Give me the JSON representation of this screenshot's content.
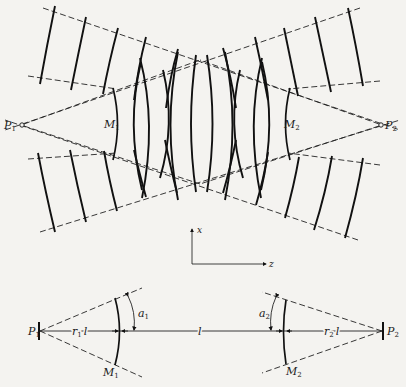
{
  "figure": {
    "top_diagram": {
      "description": "Unstable resonator wavefronts between mirrors M1 and M2 with virtual point sources P1 and P2",
      "labels": {
        "p1": "P",
        "p1_sub": "1",
        "p2": "P",
        "p2_sub": "2",
        "m1": "M",
        "m1_sub": "1",
        "m2": "M",
        "m2_sub": "2"
      }
    },
    "axes": {
      "x_label": "x",
      "z_label": "z"
    },
    "bottom_diagram": {
      "labels": {
        "p1": "P",
        "p1_sub": "1",
        "p2": "P",
        "p2_sub": "2",
        "m1": "M",
        "m1_sub": "1",
        "m2": "M",
        "m2_sub": "2",
        "a1": "a",
        "a1_sub": "1",
        "a2": "a",
        "a2_sub": "2",
        "r1l": "r",
        "r1l_sub": "1",
        "r1l_suffix": "l",
        "r2l": "r",
        "r2l_sub": "2",
        "r2l_suffix": "l",
        "l": "l"
      }
    }
  }
}
